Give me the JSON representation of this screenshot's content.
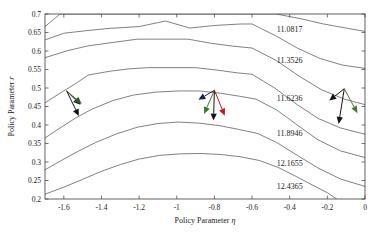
{
  "chart_data": {
    "type": "line",
    "subtype": "contour",
    "title": "",
    "xlabel": "Policy Parameter η",
    "ylabel": "Policy Parameter r",
    "xlim": [
      -1.7,
      0
    ],
    "ylim": [
      0.2,
      0.7
    ],
    "xticks": [
      -1.6,
      -1.4,
      -1.2,
      -1,
      -0.8,
      -0.6,
      -0.4,
      -0.2,
      0
    ],
    "xticklabels": [
      "-1.6",
      "-1.4",
      "-1.2",
      "-1",
      "-0.8",
      "-0.6",
      "-0.4",
      "-0.2",
      "0"
    ],
    "yticks": [
      0.2,
      0.25,
      0.3,
      0.35,
      0.4,
      0.45,
      0.5,
      0.55,
      0.6,
      0.65,
      0.7
    ],
    "yticklabels": [
      "0.2",
      "0.25",
      "0.3",
      "0.35",
      "0.4",
      "0.45",
      "0.5",
      "0.55",
      "0.6",
      "0.65",
      "0.7"
    ],
    "grid": false,
    "legend": null,
    "contour_levels": [
      11.0817,
      11.3526,
      11.6236,
      11.8946,
      12.1655,
      12.4365
    ],
    "contour_label_texts": [
      "11.0817",
      "11.3526",
      "11.6236",
      "11.8946",
      "12.1655",
      "12.4365"
    ],
    "contours": [
      {
        "level": 11.0817,
        "points": [
          [
            -1.7,
            0.666
          ],
          [
            -1.62,
            0.7
          ],
          [
            -1.54,
            0.7
          ],
          [
            -1.36,
            0.7
          ],
          [
            -1.21,
            0.7
          ],
          [
            -1.1,
            0.7
          ],
          [
            -0.99,
            0.7
          ],
          [
            -0.8,
            0.7
          ],
          [
            -0.62,
            0.7
          ],
          [
            -0.47,
            0.7
          ],
          [
            -0.33,
            0.686
          ],
          [
            -0.22,
            0.673
          ],
          [
            -0.08,
            0.66
          ],
          [
            0.0,
            0.653
          ]
        ]
      },
      {
        "level": 11.3526,
        "points": [
          [
            -1.7,
            0.63
          ],
          [
            -1.6,
            0.648
          ],
          [
            -1.48,
            0.655
          ],
          [
            -1.36,
            0.661
          ],
          [
            -1.2,
            0.666
          ],
          [
            -1.06,
            0.681
          ],
          [
            -0.93,
            0.662
          ],
          [
            -0.8,
            0.669
          ],
          [
            -0.66,
            0.673
          ],
          [
            -0.6,
            0.673
          ],
          [
            -0.47,
            0.64
          ],
          [
            -0.36,
            0.608
          ],
          [
            -0.24,
            0.58
          ],
          [
            -0.12,
            0.562
          ],
          [
            0.0,
            0.553
          ]
        ]
      },
      {
        "level": 11.6236,
        "points": [
          [
            -1.7,
            0.582
          ],
          [
            -1.58,
            0.601
          ],
          [
            -1.47,
            0.614
          ],
          [
            -1.34,
            0.623
          ],
          [
            -1.21,
            0.632
          ],
          [
            -1.08,
            0.632
          ],
          [
            -0.94,
            0.632
          ],
          [
            -0.82,
            0.621
          ],
          [
            -0.7,
            0.613
          ],
          [
            -0.6,
            0.608
          ],
          [
            -0.47,
            0.574
          ],
          [
            -0.35,
            0.532
          ],
          [
            -0.23,
            0.495
          ],
          [
            -0.11,
            0.47
          ],
          [
            0.0,
            0.455
          ]
        ]
      },
      {
        "level": 11.8946,
        "points": [
          [
            -1.7,
            0.46
          ],
          [
            -1.62,
            0.486
          ],
          [
            -1.54,
            0.511
          ],
          [
            -1.47,
            0.535
          ],
          [
            -1.36,
            0.545
          ],
          [
            -1.25,
            0.552
          ],
          [
            -1.15,
            0.555
          ],
          [
            -1.02,
            0.555
          ],
          [
            -0.9,
            0.555
          ],
          [
            -0.78,
            0.548
          ],
          [
            -0.68,
            0.541
          ],
          [
            -0.6,
            0.537
          ],
          [
            -0.48,
            0.5
          ],
          [
            -0.36,
            0.455
          ],
          [
            -0.25,
            0.418
          ],
          [
            -0.13,
            0.392
          ],
          [
            0.0,
            0.375
          ]
        ]
      },
      {
        "level": 12.1655,
        "points": [
          [
            -1.7,
            0.365
          ],
          [
            -1.62,
            0.392
          ],
          [
            -1.54,
            0.418
          ],
          [
            -1.45,
            0.443
          ],
          [
            -1.34,
            0.466
          ],
          [
            -1.23,
            0.481
          ],
          [
            -1.11,
            0.489
          ],
          [
            -0.99,
            0.492
          ],
          [
            -0.88,
            0.492
          ],
          [
            -0.77,
            0.486
          ],
          [
            -0.67,
            0.478
          ],
          [
            -0.58,
            0.47
          ],
          [
            -0.47,
            0.441
          ],
          [
            -0.36,
            0.4
          ],
          [
            -0.25,
            0.36
          ],
          [
            -0.13,
            0.33
          ],
          [
            0.0,
            0.312
          ]
        ]
      },
      {
        "level": 12.4365,
        "points": [
          [
            -1.7,
            0.279
          ],
          [
            -1.61,
            0.305
          ],
          [
            -1.52,
            0.33
          ],
          [
            -1.43,
            0.353
          ],
          [
            -1.32,
            0.376
          ],
          [
            -1.21,
            0.394
          ],
          [
            -1.1,
            0.404
          ],
          [
            -0.99,
            0.408
          ],
          [
            -0.88,
            0.405
          ],
          [
            -0.77,
            0.398
          ],
          [
            -0.67,
            0.388
          ],
          [
            -0.57,
            0.377
          ],
          [
            -0.47,
            0.353
          ],
          [
            -0.36,
            0.318
          ],
          [
            -0.25,
            0.284
          ],
          [
            -0.13,
            0.254
          ],
          [
            0.0,
            0.234
          ]
        ]
      },
      {
        "level": 12.7,
        "points": [
          [
            -1.7,
            0.213
          ],
          [
            -1.6,
            0.232
          ],
          [
            -1.5,
            0.253
          ],
          [
            -1.4,
            0.275
          ],
          [
            -1.3,
            0.293
          ],
          [
            -1.2,
            0.308
          ],
          [
            -1.09,
            0.318
          ],
          [
            -0.98,
            0.322
          ],
          [
            -0.87,
            0.323
          ],
          [
            -0.76,
            0.32
          ],
          [
            -0.66,
            0.314
          ],
          [
            -0.56,
            0.304
          ],
          [
            -0.46,
            0.285
          ],
          [
            -0.37,
            0.262
          ],
          [
            -0.28,
            0.238
          ],
          [
            -0.2,
            0.217
          ],
          [
            -0.15,
            0.2
          ]
        ]
      }
    ],
    "contour_label_positions": [
      {
        "text": "11.0817",
        "x": -0.4,
        "y": 0.651
      },
      {
        "text": "11.3526",
        "x": -0.4,
        "y": 0.569
      },
      {
        "text": "11.6236",
        "x": -0.4,
        "y": 0.466
      },
      {
        "text": "11.8946",
        "x": -0.4,
        "y": 0.371
      },
      {
        "text": "12.1655",
        "x": -0.4,
        "y": 0.288
      },
      {
        "text": "12.4365",
        "x": -0.4,
        "y": 0.228
      }
    ],
    "annotations": {
      "description": "Three clusters of gradient/update arrows overlaid on the contour map",
      "clusters": [
        {
          "name": "left-arrow-cluster",
          "origin": [
            -1.585,
            0.492
          ],
          "arrows": [
            {
              "color": "#141414",
              "tip": [
                -1.52,
                0.424
              ],
              "label": "black-arrow"
            },
            {
              "color": "#141414",
              "tip": [
                -1.512,
                0.455
              ],
              "label": "black-arrow"
            },
            {
              "color": "#2d5f1f",
              "tip": [
                -1.505,
                0.457
              ],
              "label": "green-arrow"
            }
          ]
        },
        {
          "name": "middle-arrow-cluster",
          "origin": [
            -0.8,
            0.494
          ],
          "arrows": [
            {
              "color": "#11224d",
              "tip": [
                -0.885,
                0.468
              ],
              "label": "blue-arrow"
            },
            {
              "color": "#3a7a2a",
              "tip": [
                -0.855,
                0.43
              ],
              "label": "green-arrow"
            },
            {
              "color": "#141414",
              "tip": [
                -0.805,
                0.412
              ],
              "label": "black-arrow"
            },
            {
              "color": "#cc1414",
              "tip": [
                -0.745,
                0.425
              ],
              "label": "red-arrow"
            }
          ]
        },
        {
          "name": "right-arrow-cluster",
          "origin": [
            -0.11,
            0.498
          ],
          "arrows": [
            {
              "color": "#141414",
              "tip": [
                -0.19,
                0.466
              ],
              "label": "black-arrow"
            },
            {
              "color": "#141414",
              "tip": [
                -0.14,
                0.403
              ],
              "label": "black-arrow"
            },
            {
              "color": "#4a7a35",
              "tip": [
                -0.04,
                0.432
              ],
              "label": "green-arrow"
            }
          ]
        }
      ]
    },
    "colors": {
      "contour_line": "#4a4a52",
      "axis": "#3a3a3a",
      "text": "#1a1a1a",
      "arrow_black": "#141414",
      "arrow_green": "#3a7a2a",
      "arrow_red": "#cc1414",
      "arrow_blue": "#11224d",
      "background": "#ffffff"
    }
  }
}
